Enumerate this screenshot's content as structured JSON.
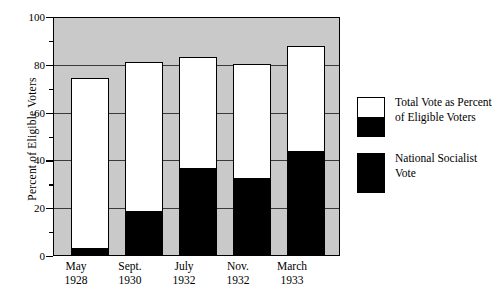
{
  "chart_data": {
    "type": "bar",
    "title": "",
    "xlabel": "",
    "ylabel": "Percent of Eligible Voters",
    "ylim": [
      0,
      100
    ],
    "ytick_labels": [
      "0",
      "20",
      "40",
      "60",
      "80",
      "100"
    ],
    "ytick_values": [
      0,
      20,
      40,
      60,
      80,
      100
    ],
    "yminor_values": [
      10,
      30,
      50,
      70,
      90
    ],
    "gridlines": [
      20,
      40,
      60,
      80
    ],
    "grid": true,
    "legend_position": "right",
    "categories": [
      {
        "line1": "May",
        "line2": "1928"
      },
      {
        "line1": "Sept.",
        "line2": "1930"
      },
      {
        "line1": "July",
        "line2": "1932"
      },
      {
        "line1": "Nov.",
        "line2": "1932"
      },
      {
        "line1": "March",
        "line2": "1933"
      }
    ],
    "series": [
      {
        "name": "Total Vote as Percent of Eligible Voters",
        "color": "#ffffff",
        "values": [
          74.6,
          81.4,
          83.4,
          80.6,
          88.0
        ]
      },
      {
        "name": "National Socialist Vote",
        "color": "#000000",
        "values": [
          2.6,
          18.3,
          36.2,
          32.1,
          43.5
        ]
      }
    ]
  },
  "legend": {
    "items": [
      {
        "swatch": "split-white-black",
        "line1": "Total Vote as Percent",
        "line2": "of Eligible Voters"
      },
      {
        "swatch": "solid-black",
        "line1": "National Socialist",
        "line2": "Vote"
      }
    ]
  },
  "colors": {
    "plot_background": "#c9c9c9",
    "axis": "#000000",
    "gridline": "#3a3a3a",
    "bar_total": "#ffffff",
    "bar_ns": "#000000",
    "page_background": "#ffffff"
  }
}
